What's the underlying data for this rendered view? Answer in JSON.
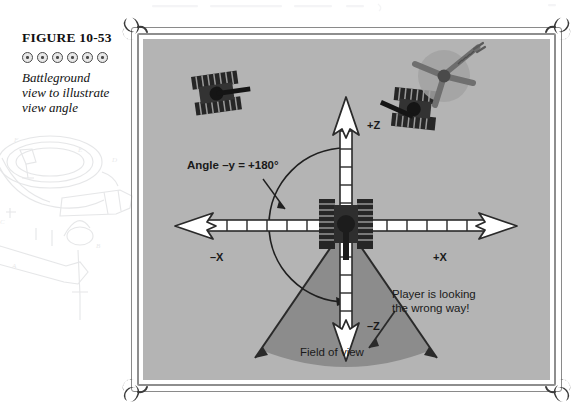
{
  "caption": {
    "figure_label": "FIGURE 10-53",
    "ornament_count": 6,
    "description_lines": [
      "Battleground",
      "view to illustrate",
      "view angle"
    ]
  },
  "diagram": {
    "axes": {
      "positive_z": "+Z",
      "negative_z": "–Z",
      "positive_x": "+X",
      "negative_x": "–X"
    },
    "annotations": {
      "angle": "Angle –y = +180°",
      "field_of_view": "Field of view",
      "player_note_line1": "Player is looking",
      "player_note_line2": "the wrong way!"
    },
    "objects": {
      "player_tank": "player-tank-at-origin",
      "enemy_tank_left": "enemy-tank-upper-left",
      "enemy_tank_right": "enemy-tank-upper-right",
      "helicopter": "helicopter-top-right"
    }
  },
  "colors": {
    "panel_background": "#b4b4b4",
    "fov_cone": "#8c8c8c",
    "vehicle_dark": "#262626",
    "frame_gray": "#8a8a8a",
    "text_dark": "#1a1a1a",
    "arrow_fill": "#ffffff",
    "helicopter_disc": "#a2a2a2"
  }
}
